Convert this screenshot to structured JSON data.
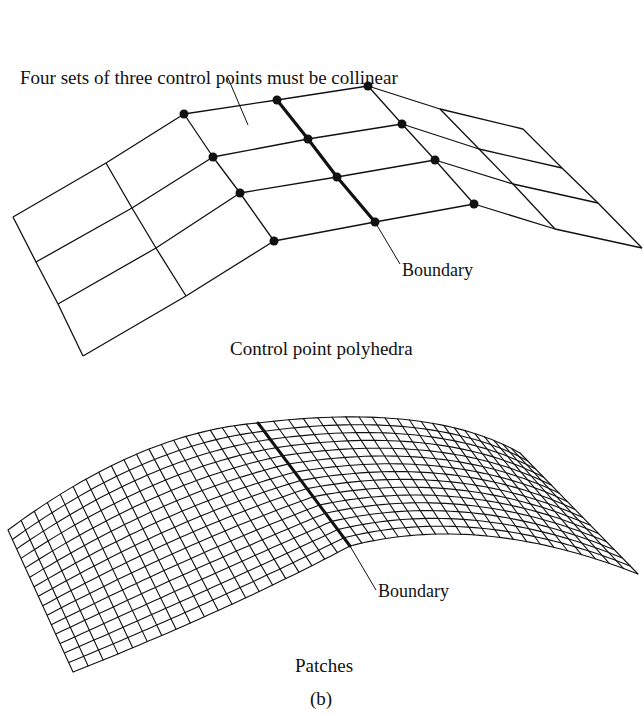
{
  "figure": {
    "label": "(b)",
    "ink_color": "#111111",
    "background": "#ffffff"
  },
  "top_panel": {
    "caption": "Control point polyhedra",
    "annotation_collinear": "Four sets of three control points must be collinear",
    "annotation_boundary": "Boundary",
    "left_patch_grid": {
      "columns": [
        [
          [
            13,
            217
          ],
          [
            36,
            262
          ],
          [
            58,
            304
          ],
          [
            83,
            356
          ]
        ],
        [
          [
            106,
            163
          ],
          [
            132,
            208
          ],
          [
            156,
            248
          ],
          [
            186,
            296
          ]
        ],
        [
          [
            184,
            114
          ],
          [
            213,
            157
          ],
          [
            240,
            193
          ],
          [
            274,
            241
          ]
        ]
      ]
    },
    "shared_boundary_column": [
      [
        277,
        100
      ],
      [
        308,
        139
      ],
      [
        337,
        177
      ],
      [
        375,
        222
      ]
    ],
    "right_patch_grid": {
      "columns": [
        [
          [
            368,
            86
          ],
          [
            402,
            124
          ],
          [
            435,
            160
          ],
          [
            474,
            204
          ]
        ],
        [
          [
            440,
            109
          ],
          [
            479,
            149
          ],
          [
            513,
            184
          ],
          [
            555,
            229
          ]
        ],
        [
          [
            523,
            129
          ],
          [
            562,
            168
          ],
          [
            598,
            203
          ],
          [
            642,
            248
          ]
        ]
      ]
    },
    "highlighted_control_points": [
      [
        184,
        114
      ],
      [
        213,
        157
      ],
      [
        240,
        193
      ],
      [
        274,
        241
      ],
      [
        277,
        100
      ],
      [
        308,
        139
      ],
      [
        337,
        177
      ],
      [
        375,
        222
      ],
      [
        368,
        86
      ],
      [
        402,
        124
      ],
      [
        435,
        160
      ],
      [
        474,
        204
      ]
    ]
  },
  "bottom_panel": {
    "caption": "Patches",
    "annotation_boundary": "Boundary",
    "surface": {
      "left_edge": [
        [
          8,
          530
        ],
        [
          73,
          672
        ]
      ],
      "boundary_curve": [
        [
          258,
          423
        ],
        [
          350,
          546
        ]
      ],
      "right_edge": [
        [
          520,
          453
        ],
        [
          638,
          574
        ]
      ],
      "u_lines_left": 20,
      "u_lines_right": 22,
      "v_lines": 15
    }
  }
}
